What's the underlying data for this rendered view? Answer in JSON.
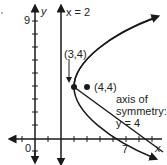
{
  "diagram": {
    "type": "coordinate-graph",
    "axes": {
      "x_label": "x",
      "y_label": "y",
      "origin_label": "0",
      "x_tick_label": "7",
      "y_tick_label": "9"
    },
    "vertical_line": {
      "label": "x = 2",
      "x": 2
    },
    "vertex": {
      "label": "(3,4)",
      "x": 3,
      "y": 4
    },
    "focus_point": {
      "label": "(4,4)",
      "x": 4,
      "y": 4
    },
    "axis_of_symmetry": {
      "line1": "axis of",
      "line2": "symmetry:",
      "line3": "y = 4"
    },
    "curve": {
      "equation": "x = (y-4)^2/4 + 3",
      "x_intercept": 7
    },
    "colors": {
      "stroke": "#1a1a1a",
      "background": "#ffffff"
    }
  }
}
